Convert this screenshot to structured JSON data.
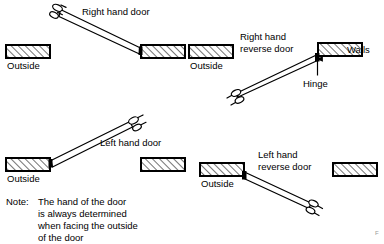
{
  "figure": {
    "type": "architectural-door-handing-diagram",
    "background_color": "#ffffff",
    "ink_color": "#000000",
    "width": 384,
    "height": 244
  },
  "panels": [
    {
      "id": "right-hand-door",
      "title": "Right hand door",
      "outside_label": "Outside",
      "hinge_side": "right",
      "swing": "toward-viewer-left-up"
    },
    {
      "id": "right-hand-reverse-door",
      "title_line1": "Right hand",
      "title_line2": "reverse door",
      "outside_label": "Outside",
      "walls_label": "Walls",
      "hinge_label": "Hinge",
      "hinge_side": "right",
      "swing": "away-left-down"
    },
    {
      "id": "left-hand-door",
      "title": "Left hand door",
      "outside_label": "Outside",
      "hinge_side": "left",
      "swing": "toward-viewer-right-up"
    },
    {
      "id": "left-hand-reverse-door",
      "title_line1": "Left hand",
      "title_line2": "reverse door",
      "outside_label": "Outside",
      "hinge_side": "left",
      "swing": "away-right-down"
    }
  ],
  "labels": {
    "right_hand_door": "Right hand door",
    "right_hand_reverse_l1": "Right hand",
    "right_hand_reverse_l2": "reverse door",
    "left_hand_door": "Left hand door",
    "left_hand_reverse_l1": "Left hand",
    "left_hand_reverse_l2": "reverse door",
    "walls": "Walls",
    "hinge": "Hinge",
    "outside_1": "Outside",
    "outside_2": "Outside",
    "outside_3": "Outside",
    "outside_4": "Outside"
  },
  "note": {
    "prefix": "Note:",
    "line1": "The hand of the door",
    "line2": "is always determined",
    "line3": "when facing the outside",
    "line4": "of the door",
    "full_text": "Note: The hand of the door is always determined when facing the outside of the door"
  },
  "page_mark": "F"
}
